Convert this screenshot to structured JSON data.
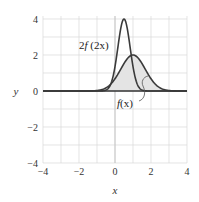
{
  "chart_data": {
    "type": "line",
    "title": "",
    "xlabel": "x",
    "ylabel": "y",
    "xlim": [
      -4,
      4
    ],
    "ylim": [
      -4,
      4
    ],
    "grid": true,
    "grid_step": 1,
    "x_ticks": [
      -4,
      -2,
      0,
      2,
      4
    ],
    "y_ticks": [
      -4,
      -2,
      0,
      2,
      4
    ],
    "x_tick_labels": [
      "−4",
      "−2",
      "0",
      "2",
      "4"
    ],
    "y_tick_labels": [
      "−4",
      "−2",
      "0",
      "2",
      "4"
    ],
    "legend": "none",
    "series": [
      {
        "name": "f(x)",
        "label": "f(x)",
        "shape": "gaussian",
        "peak_x": 1,
        "peak_y": 2,
        "sigma": 0.68,
        "shaded": true,
        "x": [
          -1,
          -0.5,
          0,
          0.5,
          1,
          1.5,
          2,
          2.5,
          3
        ],
        "values": [
          0.03,
          0.18,
          0.68,
          1.52,
          2.0,
          1.52,
          0.68,
          0.18,
          0.03
        ]
      },
      {
        "name": "2f(2x)",
        "label": "2f (2x)",
        "shape": "gaussian",
        "peak_x": 0.5,
        "peak_y": 4,
        "sigma": 0.34,
        "shaded": false,
        "x": [
          -0.5,
          -0.25,
          0,
          0.25,
          0.5,
          0.75,
          1,
          1.25,
          1.5
        ],
        "values": [
          0.05,
          0.36,
          1.36,
          3.04,
          4.0,
          3.04,
          1.36,
          0.36,
          0.05
        ]
      }
    ],
    "annotations": [
      {
        "text": "2f (2x)",
        "near": "narrow peak",
        "position": [
          -1.6,
          2.5
        ]
      },
      {
        "text": "f(x)",
        "near": "broad curve",
        "position": [
          0.8,
          -0.7
        ]
      }
    ]
  },
  "labels": {
    "x_axis": "x",
    "y_axis": "y",
    "curve_narrow_prefix": "2",
    "curve_narrow_f": "f",
    "curve_narrow_arg": " (2x)",
    "curve_broad_f": "f",
    "curve_broad_arg": "(x)"
  },
  "colors": {
    "curve": "#3a3a3a",
    "shade": "#e4e4e4",
    "grid": "#d8d8d8",
    "axis": "#333333"
  }
}
